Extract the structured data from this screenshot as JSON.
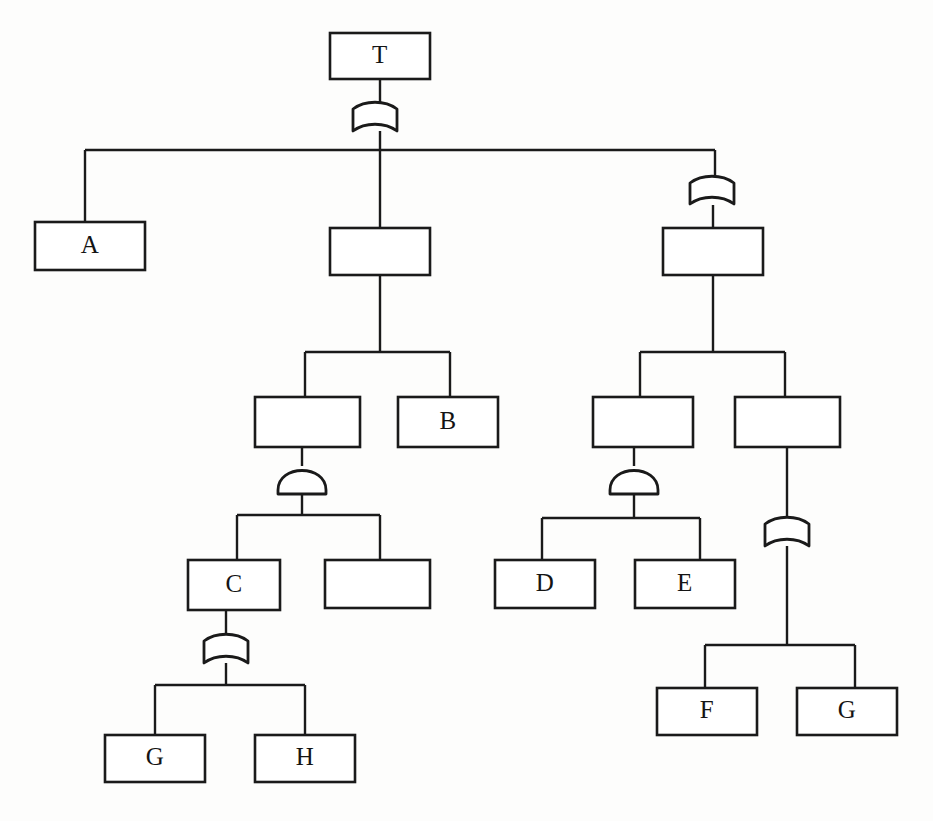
{
  "diagram": {
    "type": "and-or-tree",
    "background_color": "#fdfdfc",
    "line_color": "#1a1a1a",
    "box_fill_color": "#ffffff",
    "nodes": [
      {
        "id": "n-root",
        "label": "T",
        "x": 330,
        "y": 33,
        "w": 100,
        "h": 46
      },
      {
        "id": "n-a",
        "label": "A",
        "x": 35,
        "y": 222,
        "w": 110,
        "h": 48
      },
      {
        "id": "n-mid",
        "label": "",
        "x": 330,
        "y": 228,
        "w": 100,
        "h": 47
      },
      {
        "id": "n-right",
        "label": "",
        "x": 663,
        "y": 228,
        "w": 100,
        "h": 47
      },
      {
        "id": "n-m-l",
        "label": "",
        "x": 255,
        "y": 397,
        "w": 105,
        "h": 50
      },
      {
        "id": "n-b",
        "label": "B",
        "x": 398,
        "y": 397,
        "w": 100,
        "h": 50
      },
      {
        "id": "n-r-l",
        "label": "",
        "x": 593,
        "y": 397,
        "w": 100,
        "h": 50
      },
      {
        "id": "n-r-r",
        "label": "",
        "x": 735,
        "y": 397,
        "w": 105,
        "h": 50
      },
      {
        "id": "n-c",
        "label": "C",
        "x": 188,
        "y": 560,
        "w": 92,
        "h": 50
      },
      {
        "id": "n-m-l-r",
        "label": "",
        "x": 325,
        "y": 560,
        "w": 105,
        "h": 48
      },
      {
        "id": "n-d",
        "label": "D",
        "x": 495,
        "y": 560,
        "w": 100,
        "h": 48
      },
      {
        "id": "n-e",
        "label": "E",
        "x": 635,
        "y": 560,
        "w": 100,
        "h": 48
      },
      {
        "id": "n-f",
        "label": "F",
        "x": 657,
        "y": 688,
        "w": 100,
        "h": 47
      },
      {
        "id": "n-g2",
        "label": "G",
        "x": 797,
        "y": 688,
        "w": 100,
        "h": 47
      },
      {
        "id": "n-g1",
        "label": "G",
        "x": 105,
        "y": 735,
        "w": 100,
        "h": 47
      },
      {
        "id": "n-h",
        "label": "H",
        "x": 255,
        "y": 735,
        "w": 100,
        "h": 47
      }
    ],
    "markers": [
      {
        "id": "mk-root",
        "shape": "cup",
        "cx": 375,
        "cy": 104,
        "w": 44,
        "h": 27
      },
      {
        "id": "mk-right",
        "shape": "cup",
        "cx": 712,
        "cy": 178,
        "w": 44,
        "h": 26
      },
      {
        "id": "mk-m-l",
        "shape": "dome",
        "cx": 302,
        "cy": 466,
        "w": 48,
        "h": 28
      },
      {
        "id": "mk-r-l",
        "shape": "dome",
        "cx": 634,
        "cy": 466,
        "w": 48,
        "h": 28
      },
      {
        "id": "mk-r-r",
        "shape": "cup",
        "cx": 787,
        "cy": 519,
        "w": 44,
        "h": 27
      },
      {
        "id": "mk-c",
        "shape": "cup",
        "cx": 226,
        "cy": 636,
        "w": 44,
        "h": 27
      }
    ],
    "legend": {
      "cup_marker_name": "xor-partition-marker",
      "dome_marker_name": "and-decomposition-marker"
    },
    "edges": [
      {
        "id": "e-root-stem",
        "kind": "vertical",
        "x": 380,
        "y1": 79,
        "y2": 104
      },
      {
        "id": "e-root-down",
        "kind": "vertical",
        "x": 380,
        "y1": 131,
        "y2": 150
      },
      {
        "id": "e-root-bar",
        "kind": "horizontal",
        "y": 150,
        "x1": 85,
        "x2": 715
      },
      {
        "id": "e-to-a",
        "kind": "vertical",
        "x": 85,
        "y1": 150,
        "y2": 222
      },
      {
        "id": "e-to-mid",
        "kind": "vertical",
        "x": 380,
        "y1": 150,
        "y2": 228
      },
      {
        "id": "e-to-right-mk",
        "kind": "vertical",
        "x": 715,
        "y1": 150,
        "y2": 178
      },
      {
        "id": "e-right-mk-box",
        "kind": "vertical",
        "x": 713,
        "y1": 205,
        "y2": 228
      },
      {
        "id": "e-mid-down",
        "kind": "vertical",
        "x": 380,
        "y1": 275,
        "y2": 352
      },
      {
        "id": "e-mid-bar",
        "kind": "horizontal",
        "y": 352,
        "x1": 305,
        "x2": 450
      },
      {
        "id": "e-mid-l",
        "kind": "vertical",
        "x": 305,
        "y1": 352,
        "y2": 397
      },
      {
        "id": "e-mid-b",
        "kind": "vertical",
        "x": 450,
        "y1": 352,
        "y2": 397
      },
      {
        "id": "e-ml-to-mk",
        "kind": "vertical",
        "x": 302,
        "y1": 447,
        "y2": 466
      },
      {
        "id": "e-ml-mk-down",
        "kind": "vertical",
        "x": 302,
        "y1": 494,
        "y2": 515
      },
      {
        "id": "e-ml-bar",
        "kind": "horizontal",
        "y": 515,
        "x1": 237,
        "x2": 380
      },
      {
        "id": "e-to-c",
        "kind": "vertical",
        "x": 237,
        "y1": 515,
        "y2": 560
      },
      {
        "id": "e-to-mlr",
        "kind": "vertical",
        "x": 380,
        "y1": 515,
        "y2": 560
      },
      {
        "id": "e-c-to-mk",
        "kind": "vertical",
        "x": 226,
        "y1": 610,
        "y2": 636
      },
      {
        "id": "e-c-mk-down",
        "kind": "vertical",
        "x": 226,
        "y1": 663,
        "y2": 685
      },
      {
        "id": "e-c-bar",
        "kind": "horizontal",
        "y": 685,
        "x1": 155,
        "x2": 305
      },
      {
        "id": "e-to-g1",
        "kind": "vertical",
        "x": 155,
        "y1": 685,
        "y2": 735
      },
      {
        "id": "e-to-h",
        "kind": "vertical",
        "x": 305,
        "y1": 685,
        "y2": 735
      },
      {
        "id": "e-right-down",
        "kind": "vertical",
        "x": 713,
        "y1": 275,
        "y2": 352
      },
      {
        "id": "e-right-bar",
        "kind": "horizontal",
        "y": 352,
        "x1": 640,
        "x2": 785
      },
      {
        "id": "e-right-l",
        "kind": "vertical",
        "x": 640,
        "y1": 352,
        "y2": 397
      },
      {
        "id": "e-right-r",
        "kind": "vertical",
        "x": 785,
        "y1": 352,
        "y2": 397
      },
      {
        "id": "e-rl-to-mk",
        "kind": "vertical",
        "x": 634,
        "y1": 447,
        "y2": 466
      },
      {
        "id": "e-rl-mk-down",
        "kind": "vertical",
        "x": 634,
        "y1": 494,
        "y2": 518
      },
      {
        "id": "e-rl-bar",
        "kind": "horizontal",
        "y": 518,
        "x1": 542,
        "x2": 700
      },
      {
        "id": "e-to-d",
        "kind": "vertical",
        "x": 542,
        "y1": 518,
        "y2": 560
      },
      {
        "id": "e-to-e",
        "kind": "vertical",
        "x": 700,
        "y1": 518,
        "y2": 560
      },
      {
        "id": "e-rr-to-mk",
        "kind": "vertical",
        "x": 787,
        "y1": 447,
        "y2": 519
      },
      {
        "id": "e-rr-mk-down",
        "kind": "vertical",
        "x": 787,
        "y1": 546,
        "y2": 645
      },
      {
        "id": "e-rr-bar",
        "kind": "horizontal",
        "y": 645,
        "x1": 705,
        "x2": 855
      },
      {
        "id": "e-to-f",
        "kind": "vertical",
        "x": 705,
        "y1": 645,
        "y2": 688
      },
      {
        "id": "e-to-g2",
        "kind": "vertical",
        "x": 855,
        "y1": 645,
        "y2": 688
      }
    ]
  }
}
